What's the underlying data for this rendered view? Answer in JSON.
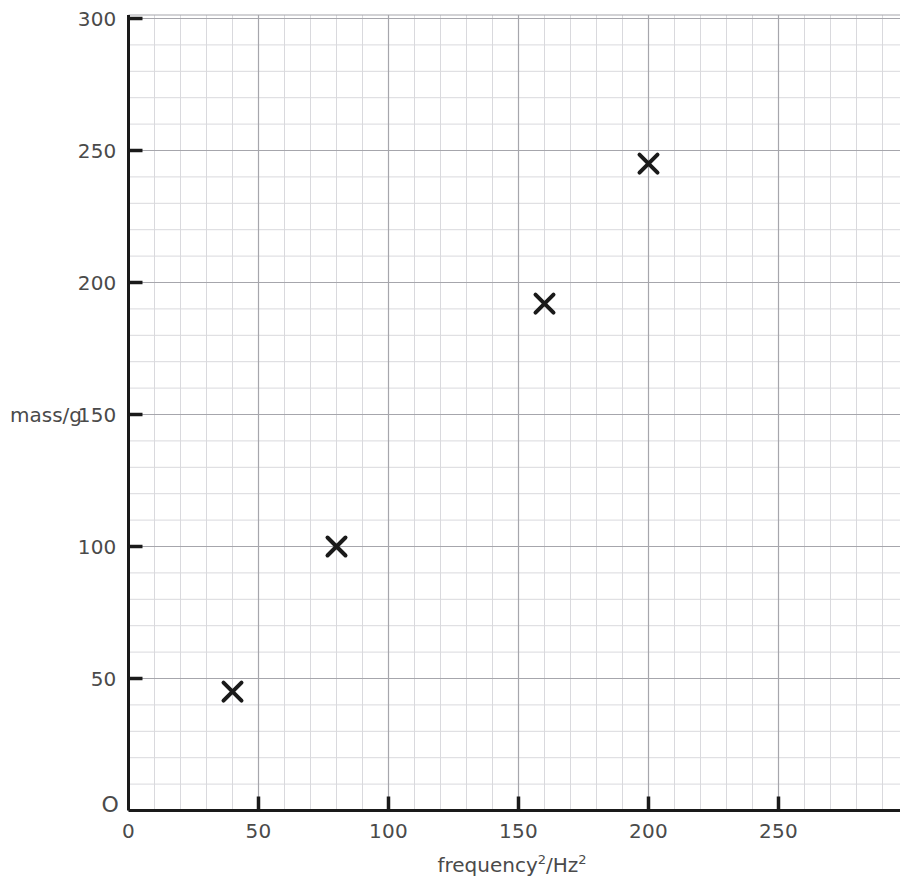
{
  "chart_data": {
    "type": "scatter",
    "title": "",
    "xlabel": "frequency²/Hz²",
    "xlabel_parts": {
      "base": "frequency",
      "sup1": "2",
      "sep": "/Hz",
      "sup2": "2"
    },
    "ylabel": "mass/g",
    "x": [
      40,
      80,
      160,
      200
    ],
    "values": [
      45,
      100,
      192,
      245
    ],
    "points": [
      {
        "x": 40,
        "y": 45
      },
      {
        "x": 80,
        "y": 100
      },
      {
        "x": 160,
        "y": 192
      },
      {
        "x": 200,
        "y": 245
      }
    ],
    "marker": "x-cross",
    "marker_color": "#1a1a1a",
    "xlim": [
      0,
      297
    ],
    "ylim": [
      0,
      303
    ],
    "xticks": [
      0,
      50,
      100,
      150,
      200,
      250
    ],
    "xtick_labels": [
      "0",
      "50",
      "100",
      "150",
      "200",
      "250"
    ],
    "yticks": [
      0,
      50,
      100,
      150,
      200,
      250,
      300
    ],
    "ytick_labels": [
      "0",
      "50",
      "100",
      "150",
      "200",
      "250",
      "300"
    ],
    "origin_label": "O",
    "grid": true,
    "grid_minor_step": 10,
    "grid_major_step": 50,
    "grid_minor_color": "#d9d9dd",
    "grid_major_color": "#a6a6ac",
    "axis_color": "#1a1a1a",
    "legend": null,
    "legend_position": "none"
  },
  "axes": {
    "y_title": "mass/g",
    "origin_letter": "O"
  }
}
